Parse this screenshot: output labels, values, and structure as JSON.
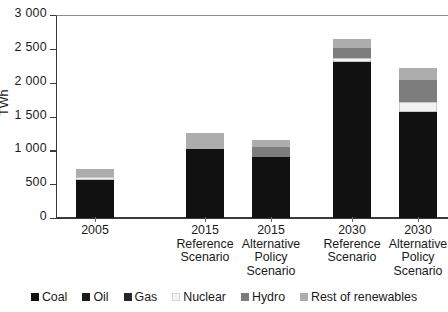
{
  "chart_data": {
    "type": "bar",
    "subtype": "stacked-bar",
    "title": "",
    "xlabel": "",
    "ylabel": "TWh",
    "ylim": [
      0,
      3000
    ],
    "yticks": [
      0,
      500,
      1000,
      1500,
      2000,
      2500,
      3000
    ],
    "ytick_labels": [
      "0",
      "500",
      "1 000",
      "1 500",
      "2 000",
      "2 500",
      "3 000"
    ],
    "grid": false,
    "legend_position": "bottom",
    "categories": [
      "2005",
      "2015 Reference Scenario",
      "2015 Alternative Policy Scenario",
      "2030 Reference Scenario",
      "2030 Alternative Policy Scenario"
    ],
    "series": [
      {
        "name": "Coal",
        "color": "#111111",
        "values": [
          560,
          1020,
          900,
          2300,
          1560
        ]
      },
      {
        "name": "Oil",
        "color": "#1b1b1b",
        "values": [
          0,
          0,
          0,
          0,
          0
        ]
      },
      {
        "name": "Gas",
        "color": "#262626",
        "values": [
          0,
          0,
          0,
          0,
          0
        ]
      },
      {
        "name": "Nuclear",
        "color": "#f2f2f2",
        "values": [
          40,
          0,
          0,
          70,
          150
        ]
      },
      {
        "name": "Hydro",
        "color": "#7d7d7d",
        "values": [
          0,
          0,
          150,
          150,
          330
        ]
      },
      {
        "name": "Rest of renewables",
        "color": "#adadad",
        "values": [
          130,
          240,
          100,
          120,
          170
        ]
      }
    ],
    "totals": [
      730,
      1260,
      1150,
      2640,
      2210
    ]
  },
  "axis": {
    "y_title": "TWh",
    "y_ticks": [
      {
        "label": "3 000",
        "value": 3000
      },
      {
        "label": "2 500",
        "value": 2500
      },
      {
        "label": "2 000",
        "value": 2000
      },
      {
        "label": "1 500",
        "value": 1500
      },
      {
        "label": "1 000",
        "value": 1000
      },
      {
        "label": "500",
        "value": 500
      },
      {
        "label": "0",
        "value": 0
      }
    ]
  },
  "x_categories": [
    {
      "line1": "2005",
      "line2": "",
      "line3": ""
    },
    {
      "line1": "2015",
      "line2": "Reference",
      "line3": "Scenario"
    },
    {
      "line1": "2015",
      "line2": "Alternative",
      "line3": "Policy",
      "line4": "Scenario"
    },
    {
      "line1": "2030",
      "line2": "Reference",
      "line3": "Scenario"
    },
    {
      "line1": "2030",
      "line2": "Alternative",
      "line3": "Policy",
      "line4": "Scenario"
    }
  ],
  "legend": {
    "items": [
      {
        "label": "Coal",
        "color": "#111111"
      },
      {
        "label": "Oil",
        "color": "#1b1b1b"
      },
      {
        "label": "Gas",
        "color": "#262626"
      },
      {
        "label": "Nuclear",
        "color": "#f2f2f2"
      },
      {
        "label": "Hydro",
        "color": "#7d7d7d"
      },
      {
        "label": "Rest of renewables",
        "color": "#adadad"
      }
    ]
  },
  "colors": {
    "axis": "#3a3a3a",
    "text": "#1a1a1a",
    "background": "#ffffff",
    "frame_top": "#8d8d8d"
  }
}
